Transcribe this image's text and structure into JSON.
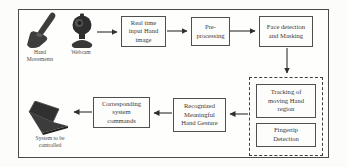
{
  "colors": {
    "line": "#2f2f2f",
    "box_border": "#4f4f4f",
    "text": "#3a3a3a",
    "background": "#fcfcfa"
  },
  "icons": [
    "hand-icon",
    "webcam-icon",
    "laptop-icon",
    "arrow-right-icon",
    "arrow-left-icon",
    "arrow-down-icon"
  ],
  "nodes": {
    "hand_caption": "Hand\nMovements",
    "webcam_caption": "Webcam",
    "realtime": "Real time\ninput Hand\nimage",
    "preprocessing": "Pre-\nprocessing",
    "face": "Face detection\nand Masking",
    "tracking": "Tracking of\nmoving Hand\nregion",
    "fingertip": "Fingertip\nDetection",
    "recognized": "Recognized\nMeaningful\nHand Gesture",
    "commands": "Corresponding\nsystem\ncommands",
    "laptop_caption": "System to be\ncontrolled"
  }
}
